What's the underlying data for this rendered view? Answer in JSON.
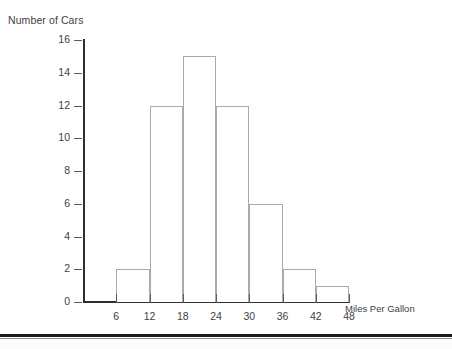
{
  "chart_data": {
    "type": "bar",
    "title": "",
    "ylabel": "Number of Cars",
    "xlabel": "Miles Per Gallon",
    "grid": false,
    "legend": "none",
    "bin_edges": [
      6,
      12,
      18,
      24,
      30,
      36,
      42,
      48
    ],
    "categories": [
      "6-12",
      "12-18",
      "18-24",
      "24-30",
      "30-36",
      "36-42",
      "42-48"
    ],
    "values": [
      2,
      12,
      15,
      12,
      6,
      2,
      1
    ],
    "xlim": [
      0,
      48
    ],
    "ylim": [
      0,
      16
    ],
    "xticks": [
      "6",
      "12",
      "18",
      "24",
      "30",
      "36",
      "42",
      "48"
    ],
    "yticks": [
      "0",
      "2",
      "4",
      "6",
      "8",
      "10",
      "12",
      "14",
      "16"
    ],
    "bar_fill": "#ffffff",
    "bar_stroke": "#aaaaaa",
    "axis_color": "#2e2e2e",
    "text_color": "#3f3f3f"
  }
}
